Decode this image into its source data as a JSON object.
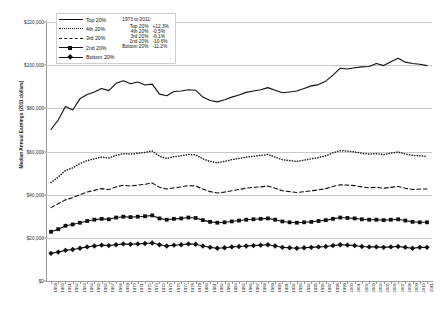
{
  "chart_data": {
    "type": "line",
    "title": "",
    "xlabel": "",
    "ylabel": "Median Annual Earnings (2011 dollars)",
    "ylim": [
      0,
      120000
    ],
    "yticks": [
      0,
      20000,
      40000,
      60000,
      80000,
      100000,
      120000
    ],
    "ytick_labels": [
      "$0",
      "$20,000",
      "$40,000",
      "$60,000",
      "$80,000",
      "$100,000",
      "$120,000"
    ],
    "grid": true,
    "legend_position": "top-left",
    "x": [
      1959,
      1960,
      1961,
      1962,
      1963,
      1964,
      1965,
      1966,
      1967,
      1968,
      1969,
      1970,
      1971,
      1972,
      1973,
      1974,
      1975,
      1976,
      1977,
      1978,
      1979,
      1980,
      1981,
      1982,
      1983,
      1984,
      1985,
      1986,
      1987,
      1988,
      1989,
      1990,
      1991,
      1992,
      1993,
      1994,
      1995,
      1996,
      1997,
      1998,
      1999,
      2000,
      2001,
      2002,
      2003,
      2004,
      2005,
      2006,
      2007,
      2008,
      2009,
      2010,
      2011
    ],
    "xtick_labels": [
      "1959",
      "1960",
      "1961",
      "1962",
      "1963",
      "1964",
      "1965",
      "1966",
      "1967",
      "1968",
      "1969",
      "1970",
      "1971",
      "1972",
      "1973",
      "1974",
      "1975",
      "1976",
      "1977",
      "1978",
      "1979",
      "1980",
      "1981",
      "1982",
      "1983",
      "1984",
      "1985",
      "1986",
      "1987",
      "1988",
      "1989",
      "1990",
      "1991",
      "1992",
      "1993",
      "1994",
      "1995",
      "1996",
      "1997",
      "1998",
      "1999",
      "2000",
      "2001",
      "2002",
      "2003",
      "2004",
      "2005",
      "2006",
      "2007",
      "2008",
      "2009",
      "2010",
      "2011"
    ],
    "series": [
      {
        "name": "Top 20%",
        "style": "solid",
        "marker": "none",
        "color": "#111111",
        "values": [
          70200,
          74600,
          80800,
          79200,
          84400,
          86400,
          87600,
          89200,
          88200,
          91600,
          92800,
          91400,
          92200,
          90800,
          91200,
          86600,
          85800,
          87800,
          88000,
          88600,
          88400,
          85200,
          83600,
          83000,
          84000,
          85200,
          86200,
          87400,
          88000,
          88600,
          89600,
          88400,
          87200,
          87600,
          88000,
          89200,
          90400,
          91000,
          92600,
          95400,
          98600,
          98200,
          98800,
          99200,
          99400,
          100800,
          99800,
          101600,
          103200,
          101400,
          100800,
          100400,
          99800
        ]
      },
      {
        "name": "4th 20%",
        "style": "dotted",
        "marker": "none",
        "color": "#111111",
        "values": [
          45600,
          48200,
          51200,
          52400,
          54400,
          55800,
          56600,
          57400,
          57000,
          58200,
          59000,
          58800,
          59200,
          59600,
          60200,
          57800,
          56800,
          57600,
          58000,
          58600,
          58400,
          56600,
          55400,
          54800,
          55400,
          56200,
          56800,
          57400,
          57800,
          58200,
          58600,
          57400,
          56200,
          55800,
          55400,
          56000,
          56600,
          57200,
          58000,
          59400,
          60400,
          60200,
          59800,
          59200,
          58800,
          59000,
          58600,
          59200,
          59800,
          58800,
          58200,
          58000,
          57800
        ]
      },
      {
        "name": "3rd 20%",
        "style": "dashed",
        "marker": "none",
        "color": "#111111",
        "values": [
          34000,
          35800,
          37600,
          38600,
          40000,
          41200,
          42000,
          42800,
          42400,
          43600,
          44400,
          44000,
          44400,
          44800,
          45400,
          43400,
          42600,
          43200,
          43600,
          44200,
          44000,
          42600,
          41400,
          40800,
          41200,
          41800,
          42400,
          43000,
          43400,
          43600,
          44000,
          43000,
          41800,
          41400,
          41000,
          41400,
          41800,
          42200,
          42800,
          43800,
          44600,
          44400,
          44200,
          43600,
          43200,
          43400,
          43000,
          43400,
          43800,
          43000,
          42400,
          42600,
          42600
        ]
      },
      {
        "name": "2nd 20%",
        "style": "solid",
        "marker": "square",
        "color": "#111111",
        "values": [
          22800,
          24000,
          25600,
          26200,
          27000,
          27800,
          28400,
          28800,
          28600,
          29400,
          29800,
          29600,
          29800,
          30000,
          30400,
          29000,
          28400,
          28800,
          29000,
          29400,
          29200,
          28200,
          27400,
          27000,
          27200,
          27600,
          28000,
          28400,
          28600,
          28800,
          29000,
          28400,
          27600,
          27200,
          27000,
          27200,
          27400,
          27800,
          28200,
          28800,
          29400,
          29200,
          29000,
          28600,
          28400,
          28400,
          28200,
          28400,
          28600,
          28000,
          27400,
          27200,
          27200
        ]
      },
      {
        "name": "Bottom 20%",
        "style": "solid",
        "marker": "diamond",
        "color": "#111111",
        "values": [
          12800,
          13400,
          14200,
          14600,
          15200,
          15800,
          16200,
          16600,
          16400,
          16800,
          17200,
          17000,
          17200,
          17400,
          17600,
          16800,
          16200,
          16600,
          16800,
          17200,
          17000,
          16200,
          15600,
          15200,
          15400,
          15800,
          16000,
          16200,
          16400,
          16600,
          16800,
          16200,
          15600,
          15400,
          15200,
          15400,
          15600,
          15800,
          16000,
          16400,
          16800,
          16600,
          16400,
          16000,
          15800,
          15800,
          15600,
          15800,
          16000,
          15600,
          15200,
          15600,
          15600
        ]
      }
    ],
    "annotation": {
      "title": "1973 to 2011:",
      "rows": [
        {
          "name": "Top 20%",
          "value": "+12.3%"
        },
        {
          "name": "4th 20%",
          "value": "-0.5%"
        },
        {
          "name": "3rd 20%",
          "value": "-6.1%"
        },
        {
          "name": "2nd 20%",
          "value": "-10.6%"
        },
        {
          "name": "Bottom 20%",
          "value": "-11.2%"
        }
      ]
    }
  }
}
